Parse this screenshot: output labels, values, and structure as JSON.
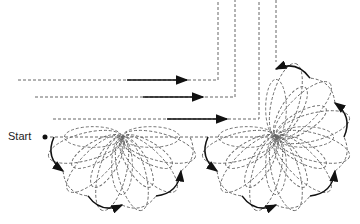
{
  "diagram": {
    "start_label": "Start",
    "colors": {
      "dashed": "#666666",
      "solid": "#111111",
      "background": "#ffffff"
    },
    "guide_lines": [
      {
        "h_from": 18,
        "y": 80,
        "corner_x": 218
      },
      {
        "h_from": 35,
        "y": 97,
        "corner_x": 235
      },
      {
        "h_from": 53,
        "y": 119,
        "corner_x": 259
      },
      {
        "h_from": 50,
        "y": 137,
        "corner_x": 276
      }
    ],
    "arrows": [
      {
        "y": 80,
        "x1": 127,
        "x2": 187
      },
      {
        "y": 97,
        "x1": 143,
        "x2": 203
      },
      {
        "y": 119,
        "x1": 167,
        "x2": 227
      }
    ],
    "start_point": {
      "x": 45,
      "y": 137
    },
    "flowers": [
      {
        "cx": 122,
        "cy": 137,
        "from_deg": 180,
        "to_deg": 0,
        "petals": 6,
        "radius": 80
      },
      {
        "cx": 276,
        "cy": 137,
        "from_deg": 180,
        "to_deg": -90,
        "petals": 9,
        "radius": 80
      }
    ]
  }
}
